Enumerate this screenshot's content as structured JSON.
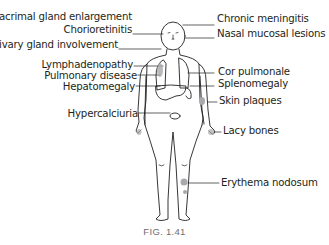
{
  "diagram": {
    "caption": "FIG. 1.41",
    "left_labels": [
      {
        "id": "lacrimal",
        "text": "Lacrimal gland enlargement"
      },
      {
        "id": "chorioretinitis",
        "text": "Chorioretinitis"
      },
      {
        "id": "salivary",
        "text": "Salivary gland involvement"
      },
      {
        "id": "lymphadenopathy",
        "text": "Lymphadenopathy"
      },
      {
        "id": "pulmonary",
        "text": "Pulmonary disease"
      },
      {
        "id": "hepatomegaly",
        "text": "Hepatomegaly"
      },
      {
        "id": "hypercalciuria",
        "text": "Hypercalciuria"
      }
    ],
    "right_labels": [
      {
        "id": "meningitis",
        "text": "Chronic meningitis"
      },
      {
        "id": "nasal",
        "text": "Nasal mucosal lesions"
      },
      {
        "id": "cor_pulmonale",
        "text": "Cor pulmonale"
      },
      {
        "id": "splenomegaly",
        "text": "Splenomegaly"
      },
      {
        "id": "skin_plaques",
        "text": "Skin plaques"
      },
      {
        "id": "lacy_bones",
        "text": "Lacy bones"
      },
      {
        "id": "erythema",
        "text": "Erythema nodosum"
      }
    ],
    "colors": {
      "line": "#231f20",
      "lesion": "#a7a9ac",
      "caption": "#6d6e71"
    }
  }
}
